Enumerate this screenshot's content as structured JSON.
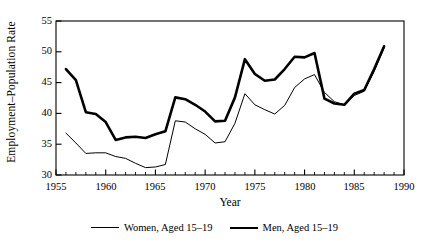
{
  "chart_data": {
    "type": "line",
    "title": "",
    "subtitle": "",
    "xlabel": "Year",
    "ylabel": "Employment–Population Rate",
    "xlim": [
      1955,
      1990
    ],
    "ylim": [
      30,
      55
    ],
    "xticks": [
      1955,
      1960,
      1965,
      1970,
      1975,
      1980,
      1985,
      1990
    ],
    "yticks": [
      30,
      35,
      40,
      45,
      50,
      55
    ],
    "minor_xticks_every": 1,
    "grid": false,
    "legend_position": "below-center",
    "x": [
      1956,
      1957,
      1958,
      1959,
      1960,
      1961,
      1962,
      1963,
      1964,
      1965,
      1966,
      1967,
      1968,
      1969,
      1970,
      1971,
      1972,
      1973,
      1974,
      1975,
      1976,
      1977,
      1978,
      1979,
      1980,
      1981,
      1982,
      1983,
      1984,
      1985,
      1986,
      1987,
      1988
    ],
    "series": [
      {
        "name": "Women, Aged 15–19",
        "line_width": "thin",
        "color": "#000000",
        "values": [
          36.8,
          35.2,
          33.5,
          33.6,
          33.6,
          33.0,
          32.7,
          31.9,
          31.2,
          31.3,
          31.7,
          38.8,
          38.6,
          37.5,
          36.6,
          35.2,
          35.4,
          38.4,
          43.2,
          41.4,
          40.6,
          39.9,
          41.3,
          44.2,
          45.6,
          46.3,
          43.4,
          41.9,
          41.4,
          42.9,
          43.6,
          46.8,
          50.6
        ]
      },
      {
        "name": "Men, Aged 15–19",
        "line_width": "thick",
        "color": "#000000",
        "values": [
          47.2,
          45.4,
          40.2,
          39.9,
          38.6,
          35.7,
          36.1,
          36.2,
          36.0,
          36.6,
          37.1,
          42.6,
          42.3,
          41.4,
          40.3,
          38.7,
          38.8,
          42.6,
          48.8,
          46.4,
          45.3,
          45.5,
          47.2,
          49.2,
          49.1,
          49.8,
          42.4,
          41.6,
          41.4,
          43.2,
          43.8,
          47.2,
          50.9
        ]
      }
    ]
  },
  "legend": {
    "entries": [
      {
        "label": "Women, Aged 15–19"
      },
      {
        "label": "Men, Aged 15–19"
      }
    ]
  },
  "axis": {
    "y_title": "Employment–Population Rate",
    "x_title": "Year",
    "y_tick_labels": [
      "55",
      "50",
      "45",
      "40",
      "35",
      "30"
    ],
    "x_tick_labels": [
      "1955",
      "1960",
      "1965",
      "1970",
      "1975",
      "1980",
      "1985",
      "1990"
    ]
  }
}
